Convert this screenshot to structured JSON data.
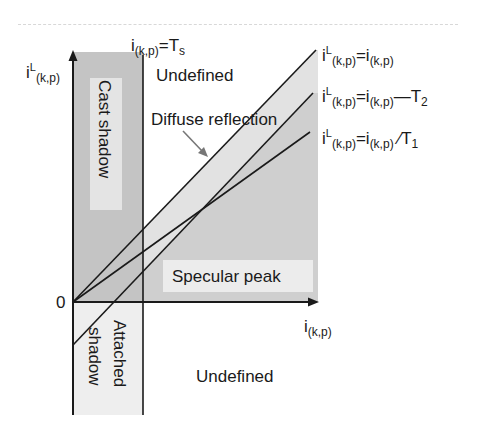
{
  "diagram": {
    "axes": {
      "y_label": {
        "base": "i",
        "sup": "L",
        "sub": "(k,p)"
      },
      "x_label": {
        "base": "i",
        "sub": "(k,p)"
      },
      "origin_label": "0"
    },
    "threshold_line": {
      "base": "i",
      "sub": "(k,p)",
      "rest": "=T",
      "rest_sub": "s"
    },
    "regions": {
      "cast_shadow": "Cast shadow",
      "attached_shadow_1": "Attached",
      "attached_shadow_2": "shadow",
      "undefined_top": "Undefined",
      "undefined_bottom": "Undefined",
      "diffuse_reflection": "Diffuse reflection",
      "specular_peak": "Specular peak"
    },
    "lines": [
      {
        "label_lhs_base": "i",
        "label_lhs_sup": "L",
        "label_lhs_sub": "(k,p)",
        "eq": "=i",
        "rhs_sub": "(k,p)",
        "tail": "",
        "tail_sub": ""
      },
      {
        "label_lhs_base": "i",
        "label_lhs_sup": "L",
        "label_lhs_sub": "(k,p)",
        "eq": "=i",
        "rhs_sub": "(k,p)",
        "tail": "—T",
        "tail_sub": "2"
      },
      {
        "label_lhs_base": "i",
        "label_lhs_sup": "L",
        "label_lhs_sub": "(k,p)",
        "eq": "=i",
        "rhs_sub": "(k,p)",
        "tail": " ∕T",
        "tail_sub": "1"
      }
    ],
    "colors": {
      "cast_shadow_fill": "#c4c4c4",
      "label_box_fill": "#e4e4e4",
      "specular_fill": "#cfcfcf",
      "diffuse_fill": "#e2e2e2",
      "attached_fill": "#eeeeee",
      "line": "#1a1a1a"
    }
  }
}
